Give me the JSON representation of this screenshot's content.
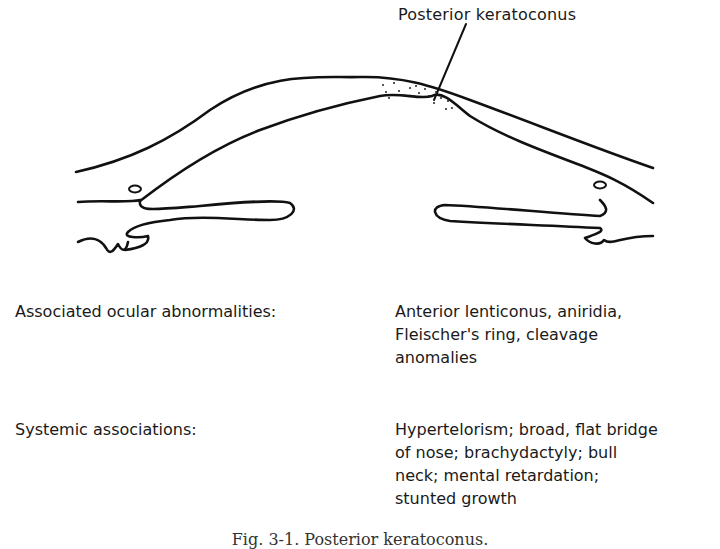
{
  "figure": {
    "callout_label": "Posterior keratoconus",
    "line_color": "#111111"
  },
  "associations": [
    {
      "term": "Associated ocular abnormalities:",
      "lines": [
        "Anterior lenticonus, aniridia,",
        "Fleischer's ring, cleavage",
        "anomalies"
      ]
    },
    {
      "term": "Systemic associations:",
      "lines": [
        "Hypertelorism; broad, flat bridge",
        "of nose; brachydactyly; bull",
        "neck; mental retardation;",
        "stunted growth"
      ]
    }
  ],
  "caption": "Fig. 3-1. Posterior keratoconus."
}
